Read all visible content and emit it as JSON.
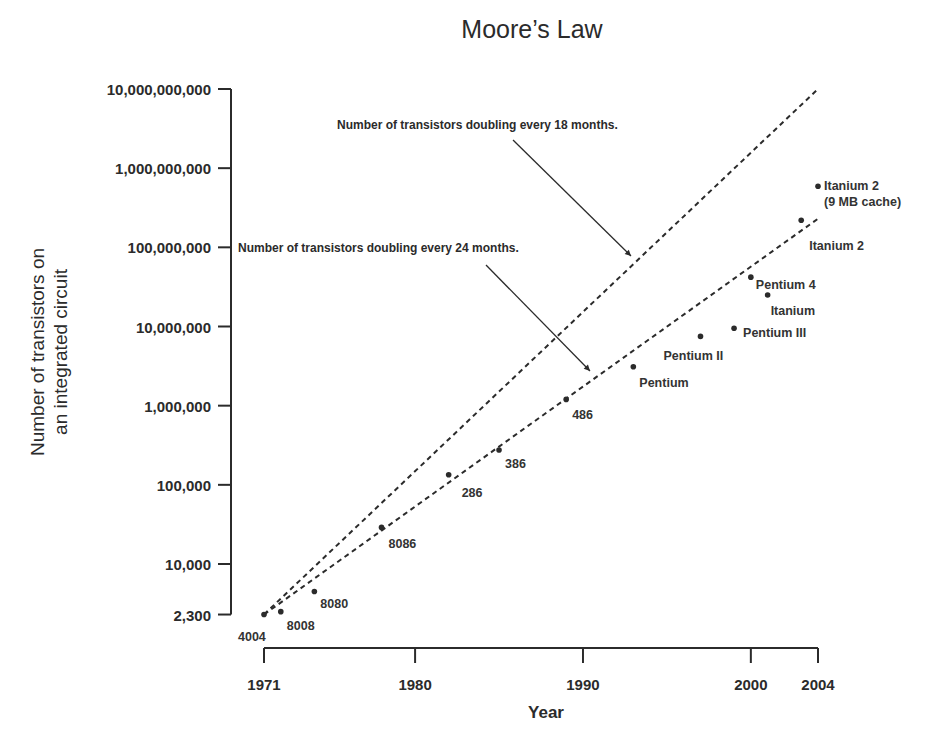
{
  "chart_data": {
    "type": "scatter",
    "title": "Moore’s Law",
    "xlabel": "Year",
    "ylabel_lines": [
      "Number of transistors on",
      "an integrated circuit"
    ],
    "yscale": "log",
    "xlim": [
      1971,
      2004
    ],
    "ylim": [
      2300,
      10000000000
    ],
    "x_ticks": [
      {
        "value": 1971,
        "label": "1971"
      },
      {
        "value": 1980,
        "label": "1980"
      },
      {
        "value": 1990,
        "label": "1990"
      },
      {
        "value": 2000,
        "label": "2000"
      },
      {
        "value": 2004,
        "label": "2004"
      }
    ],
    "y_ticks": [
      {
        "value": 2300,
        "label": "2,300"
      },
      {
        "value": 10000,
        "label": "10,000"
      },
      {
        "value": 100000,
        "label": "100,000"
      },
      {
        "value": 1000000,
        "label": "1,000,000"
      },
      {
        "value": 10000000,
        "label": "10,000,000"
      },
      {
        "value": 100000000,
        "label": "100,000,000"
      },
      {
        "value": 1000000000,
        "label": "1,000,000,000"
      },
      {
        "value": 10000000000,
        "label": "10,000,000,000"
      }
    ],
    "series": [
      {
        "name": "Intel processors",
        "points": [
          {
            "label": "4004",
            "x": 1971,
            "y": 2300,
            "lx": -26,
            "ly": 22
          },
          {
            "label": "8008",
            "x": 1972,
            "y": 2500,
            "lx": 6,
            "ly": 14
          },
          {
            "label": "8080",
            "x": 1974,
            "y": 4500,
            "lx": 6,
            "ly": 13
          },
          {
            "label": "8086",
            "x": 1978,
            "y": 29000,
            "lx": 7,
            "ly": 17
          },
          {
            "label": "286",
            "x": 1982,
            "y": 134000,
            "lx": 13,
            "ly": 18
          },
          {
            "label": "386",
            "x": 1985,
            "y": 275000,
            "lx": 6,
            "ly": 14
          },
          {
            "label": "486",
            "x": 1989,
            "y": 1200000,
            "lx": 6,
            "ly": 16
          },
          {
            "label": "Pentium",
            "x": 1993,
            "y": 3100000,
            "lx": 6,
            "ly": 16
          },
          {
            "label": "Pentium II",
            "x": 1997,
            "y": 7500000,
            "lx": -37,
            "ly": 20
          },
          {
            "label": "Pentium III",
            "x": 1999,
            "y": 9500000,
            "lx": 9,
            "ly": 5
          },
          {
            "label": "Pentium 4",
            "x": 2000,
            "y": 42000000,
            "lx": 5,
            "ly": 8
          },
          {
            "label": "Itanium",
            "x": 2001,
            "y": 25000000,
            "lx": 3,
            "ly": 16
          },
          {
            "label": "Itanium 2",
            "x": 2003,
            "y": 220000000,
            "lx": 8,
            "ly": 26
          },
          {
            "label": "Itanium 2",
            "label2": "(9 MB cache)",
            "x": 2004,
            "y": 592000000,
            "lx": 6,
            "ly": 0
          }
        ]
      }
    ],
    "trend_lines": [
      {
        "name": "18 months",
        "from": {
          "x": 1971,
          "y": 2300
        },
        "to": {
          "x": 2004,
          "y": 10000000000
        },
        "style": "dashed"
      },
      {
        "name": "24 months",
        "from": {
          "x": 1971,
          "y": 2300
        },
        "to": {
          "x": 2004,
          "y": 230000000
        },
        "style": "dashed"
      }
    ],
    "annotations": [
      {
        "text": "Number of transistors doubling every 18 months.",
        "tx": 337,
        "ty": 129,
        "x1": 513,
        "y1": 140,
        "x2": 631,
        "y2": 256
      },
      {
        "text": "Number of transistors doubling every 24 months.",
        "tx": 238,
        "ty": 252,
        "x1": 486,
        "y1": 265,
        "x2": 590,
        "y2": 371
      }
    ],
    "grid": false,
    "legend": "none"
  },
  "colors": {
    "ink": "#2b2b2b",
    "background": "#ffffff"
  }
}
